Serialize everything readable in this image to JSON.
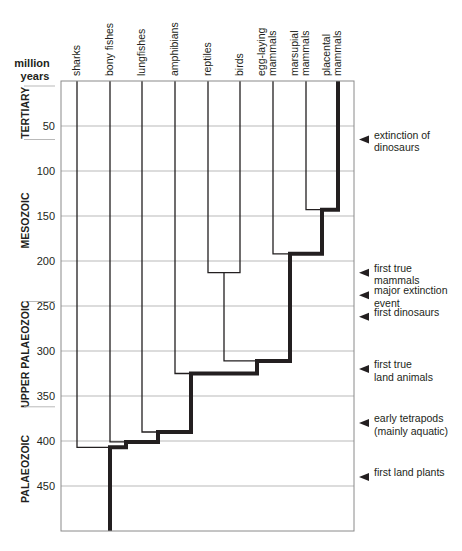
{
  "axis": {
    "title_line1": "million",
    "title_line2": "years",
    "ticks": [
      {
        "value": 50,
        "label": "50"
      },
      {
        "value": 100,
        "label": "100"
      },
      {
        "value": 150,
        "label": "150"
      },
      {
        "value": 200,
        "label": "200"
      },
      {
        "value": 250,
        "label": "250"
      },
      {
        "value": 300,
        "label": "300"
      },
      {
        "value": 350,
        "label": "350"
      },
      {
        "value": 400,
        "label": "400"
      },
      {
        "value": 450,
        "label": "450"
      }
    ],
    "range": [
      0,
      500
    ]
  },
  "eras": [
    {
      "label": "TERTIARY",
      "from": 0,
      "to": 65
    },
    {
      "label": "MESOZOIC",
      "from": 65,
      "to": 245
    },
    {
      "label": "UPPER PALAEOZOIC",
      "from": 245,
      "to": 362
    },
    {
      "label": "PALAEOZOIC",
      "from": 362,
      "to": 500
    }
  ],
  "taxa": [
    {
      "lines": [
        "sharks"
      ]
    },
    {
      "lines": [
        "bony fishes"
      ]
    },
    {
      "lines": [
        "lungfishes"
      ]
    },
    {
      "lines": [
        "amphibians"
      ]
    },
    {
      "lines": [
        "reptiles"
      ]
    },
    {
      "lines": [
        "birds"
      ]
    },
    {
      "lines": [
        "egg-laying",
        "mammals"
      ]
    },
    {
      "lines": [
        "marsupial",
        "mammals"
      ]
    },
    {
      "lines": [
        "placental",
        "mammals"
      ]
    }
  ],
  "events": [
    {
      "value": 65,
      "lines": [
        "extinction of",
        "dinosaurs"
      ]
    },
    {
      "value": 213,
      "lines": [
        "first true",
        "mammals"
      ]
    },
    {
      "value": 238,
      "lines": [
        "major extinction",
        "event"
      ]
    },
    {
      "value": 262,
      "lines": [
        "first dinosaurs"
      ]
    },
    {
      "value": 320,
      "lines": [
        "first true",
        "land animals"
      ]
    },
    {
      "value": 380,
      "lines": [
        "early tetrapods",
        "(mainly aquatic)"
      ]
    },
    {
      "value": 440,
      "lines": [
        "first land plants"
      ]
    }
  ],
  "tree": {
    "description": "Cladogram of vertebrate divergence; thick line traces lineage leading to placental mammals",
    "divergences": [
      {
        "taxon": "sharks",
        "myr": 407
      },
      {
        "taxon": "bony fishes",
        "myr": 401
      },
      {
        "taxon": "lungfishes",
        "myr": 390
      },
      {
        "taxon": "amphibians",
        "myr": 325
      },
      {
        "taxon": "reptiles+birds",
        "myr": 311
      },
      {
        "taxon": "reptiles/birds split",
        "myr": 213
      },
      {
        "taxon": "egg-laying mammals",
        "myr": 192
      },
      {
        "taxon": "marsupial mammals",
        "myr": 143
      }
    ]
  },
  "colors": {
    "line": "#231f20",
    "grid": "#b9b9b9",
    "frame": "#8a8a8a"
  }
}
